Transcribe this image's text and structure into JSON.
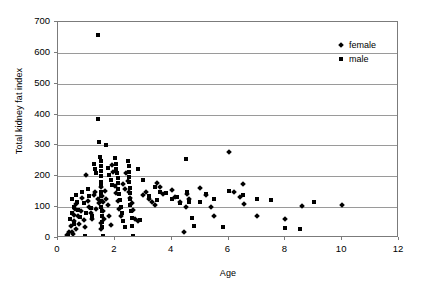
{
  "chart_data": {
    "type": "scatter",
    "title": "",
    "xlabel": "Age",
    "ylabel": "Total kidney fat index",
    "xlim": [
      0,
      12
    ],
    "ylim": [
      0,
      700
    ],
    "xticks": [
      "0",
      "2",
      "4",
      "6",
      "8",
      "10",
      "12"
    ],
    "yticks": [
      "0",
      "100",
      "200",
      "300",
      "400",
      "500",
      "600",
      "700"
    ],
    "grid": "horizontal",
    "legend_position": "top-right",
    "marker_color": "#000000",
    "series": [
      {
        "name": "female",
        "marker": "diamond",
        "points": [
          [
            0.3,
            10
          ],
          [
            0.4,
            18
          ],
          [
            0.45,
            40
          ],
          [
            0.5,
            20
          ],
          [
            0.52,
            12
          ],
          [
            0.55,
            55
          ],
          [
            0.58,
            75
          ],
          [
            0.6,
            95
          ],
          [
            0.62,
            30
          ],
          [
            0.65,
            110
          ],
          [
            0.7,
            70
          ],
          [
            0.75,
            45
          ],
          [
            0.8,
            88
          ],
          [
            0.85,
            130
          ],
          [
            0.9,
            58
          ],
          [
            0.95,
            35
          ],
          [
            1.0,
            205
          ],
          [
            1.05,
            120
          ],
          [
            1.1,
            100
          ],
          [
            1.15,
            80
          ],
          [
            1.2,
            62
          ],
          [
            1.25,
            140
          ],
          [
            1.3,
            150
          ],
          [
            1.35,
            95
          ],
          [
            1.4,
            125
          ],
          [
            1.45,
            112
          ],
          [
            1.5,
            165
          ],
          [
            1.5,
            48
          ],
          [
            1.52,
            30
          ],
          [
            1.55,
            135
          ],
          [
            1.58,
            118
          ],
          [
            1.6,
            88
          ],
          [
            1.62,
            60
          ],
          [
            1.65,
            152
          ],
          [
            1.7,
            128
          ],
          [
            1.75,
            108
          ],
          [
            1.8,
            72
          ],
          [
            1.85,
            42
          ],
          [
            1.9,
            235
          ],
          [
            1.95,
            215
          ],
          [
            2.0,
            168
          ],
          [
            2.05,
            145
          ],
          [
            2.1,
            120
          ],
          [
            2.15,
            95
          ],
          [
            2.2,
            70
          ],
          [
            2.3,
            175
          ],
          [
            2.35,
            158
          ],
          [
            2.4,
            210
          ],
          [
            2.45,
            185
          ],
          [
            2.5,
            150
          ],
          [
            2.55,
            130
          ],
          [
            2.6,
            112
          ],
          [
            2.65,
            92
          ],
          [
            2.7,
            62
          ],
          [
            2.8,
            55
          ],
          [
            3.0,
            138
          ],
          [
            3.1,
            148
          ],
          [
            3.2,
            128
          ],
          [
            3.3,
            118
          ],
          [
            3.4,
            108
          ],
          [
            3.5,
            178
          ],
          [
            3.6,
            165
          ],
          [
            3.7,
            142
          ],
          [
            4.0,
            155
          ],
          [
            4.1,
            132
          ],
          [
            4.3,
            118
          ],
          [
            4.45,
            18
          ],
          [
            4.5,
            100
          ],
          [
            4.55,
            142
          ],
          [
            4.6,
            128
          ],
          [
            5.0,
            162
          ],
          [
            5.2,
            140
          ],
          [
            5.4,
            102
          ],
          [
            5.5,
            70
          ],
          [
            6.0,
            278
          ],
          [
            6.2,
            148
          ],
          [
            6.4,
            132
          ],
          [
            6.5,
            175
          ],
          [
            6.55,
            110
          ],
          [
            7.0,
            72
          ],
          [
            8.0,
            62
          ],
          [
            8.6,
            105
          ],
          [
            10.0,
            108
          ]
        ]
      },
      {
        "name": "male",
        "marker": "square",
        "points": [
          [
            0.35,
            8
          ],
          [
            0.42,
            62
          ],
          [
            0.48,
            82
          ],
          [
            0.5,
            128
          ],
          [
            0.55,
            100
          ],
          [
            0.58,
            45
          ],
          [
            0.62,
            140
          ],
          [
            0.68,
            118
          ],
          [
            0.72,
            92
          ],
          [
            0.78,
            68
          ],
          [
            0.85,
            148
          ],
          [
            0.9,
            112
          ],
          [
            0.95,
            5
          ],
          [
            1.0,
            82
          ],
          [
            1.05,
            158
          ],
          [
            1.1,
            135
          ],
          [
            1.15,
            98
          ],
          [
            1.2,
            72
          ],
          [
            1.25,
            240
          ],
          [
            1.3,
            225
          ],
          [
            1.35,
            210
          ],
          [
            1.4,
            658
          ],
          [
            1.42,
            385
          ],
          [
            1.45,
            310
          ],
          [
            1.48,
            262
          ],
          [
            1.5,
            248
          ],
          [
            1.5,
            232
          ],
          [
            1.5,
            218
          ],
          [
            1.5,
            200
          ],
          [
            1.5,
            182
          ],
          [
            1.5,
            168
          ],
          [
            1.52,
            150
          ],
          [
            1.52,
            135
          ],
          [
            1.52,
            120
          ],
          [
            1.52,
            102
          ],
          [
            1.55,
            88
          ],
          [
            1.55,
            70
          ],
          [
            1.55,
            52
          ],
          [
            1.55,
            35
          ],
          [
            1.58,
            8
          ],
          [
            1.7,
            302
          ],
          [
            1.75,
            228
          ],
          [
            1.8,
            205
          ],
          [
            1.85,
            188
          ],
          [
            1.9,
            172
          ],
          [
            2.0,
            258
          ],
          [
            2.05,
            240
          ],
          [
            2.05,
            225
          ],
          [
            2.08,
            210
          ],
          [
            2.1,
            195
          ],
          [
            2.1,
            178
          ],
          [
            2.12,
            160
          ],
          [
            2.15,
            142
          ],
          [
            2.18,
            122
          ],
          [
            2.2,
            102
          ],
          [
            2.25,
            80
          ],
          [
            2.3,
            55
          ],
          [
            2.35,
            35
          ],
          [
            2.45,
            248
          ],
          [
            2.5,
            232
          ],
          [
            2.5,
            215
          ],
          [
            2.5,
            198
          ],
          [
            2.5,
            180
          ],
          [
            2.52,
            162
          ],
          [
            2.52,
            145
          ],
          [
            2.55,
            128
          ],
          [
            2.55,
            108
          ],
          [
            2.58,
            88
          ],
          [
            2.6,
            65
          ],
          [
            2.62,
            40
          ],
          [
            2.65,
            8
          ],
          [
            2.8,
            222
          ],
          [
            2.9,
            58
          ],
          [
            3.0,
            188
          ],
          [
            3.2,
            135
          ],
          [
            3.4,
            165
          ],
          [
            3.5,
            122
          ],
          [
            3.6,
            150
          ],
          [
            3.8,
            145
          ],
          [
            4.0,
            128
          ],
          [
            4.2,
            132
          ],
          [
            4.3,
            112
          ],
          [
            4.5,
            255
          ],
          [
            4.55,
            148
          ],
          [
            4.6,
            118
          ],
          [
            4.7,
            65
          ],
          [
            4.8,
            38
          ],
          [
            5.0,
            118
          ],
          [
            5.2,
            142
          ],
          [
            5.5,
            125
          ],
          [
            5.8,
            35
          ],
          [
            6.0,
            152
          ],
          [
            6.5,
            138
          ],
          [
            7.0,
            128
          ],
          [
            7.5,
            122
          ],
          [
            8.0,
            32
          ],
          [
            8.5,
            28
          ],
          [
            9.0,
            118
          ]
        ]
      }
    ]
  }
}
